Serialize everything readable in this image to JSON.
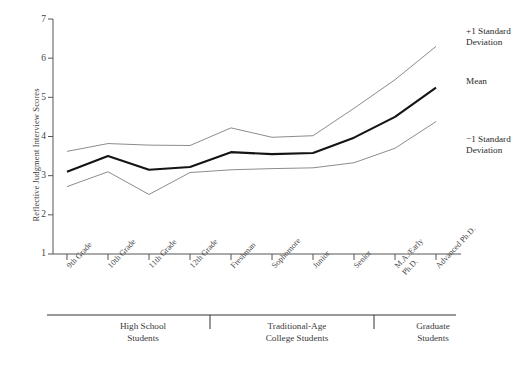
{
  "chart_data": {
    "type": "line",
    "title": "",
    "xlabel": "",
    "ylabel": "Reflective Judgment Interview Scores",
    "ylim": [
      1,
      7
    ],
    "yticks": [
      1,
      2,
      3,
      4,
      5,
      6,
      7
    ],
    "grid": false,
    "legend_position": "right",
    "categories": [
      "9th Grade",
      "10th Grade",
      "11th Grade",
      "12th Grade",
      "Freshman",
      "Sophomore",
      "Junior",
      "Senior",
      "M.A./Early Ph.D.",
      "Advanced Ph.D."
    ],
    "series": [
      {
        "name": "+1 Standard Deviation",
        "color": "#8c8c8c",
        "values": [
          3.62,
          3.82,
          3.78,
          3.77,
          4.22,
          3.98,
          4.02,
          4.72,
          5.45,
          6.3
        ]
      },
      {
        "name": "Mean",
        "color": "#141414",
        "values": [
          3.1,
          3.5,
          3.15,
          3.22,
          3.6,
          3.55,
          3.58,
          3.97,
          4.5,
          5.25
        ]
      },
      {
        "name": "-1 Standard Deviation",
        "color": "#8c8c8c",
        "values": [
          2.72,
          3.1,
          2.52,
          3.08,
          3.15,
          3.18,
          3.2,
          3.33,
          3.7,
          4.38
        ]
      }
    ],
    "group_brackets": [
      {
        "label": "High School\nStudents",
        "from": "9th Grade",
        "to": "12th Grade"
      },
      {
        "label": "Traditional-Age\nCollege Students",
        "from": "Freshman",
        "to": "Senior"
      },
      {
        "label": "Graduate\nStudents",
        "from": "M.A./Early Ph.D.",
        "to": "Advanced Ph.D."
      }
    ]
  },
  "axis": {
    "y_label": "Reflective Judgment Interview Scores",
    "y_ticks": [
      "7",
      "6",
      "5",
      "4",
      "3",
      "2",
      "1"
    ]
  },
  "xticks": [
    {
      "label": "9th Grade"
    },
    {
      "label": "10th Grade"
    },
    {
      "label": "11th Grade"
    },
    {
      "label": "12th Grade"
    },
    {
      "label": "Freshman"
    },
    {
      "label": "Sophomore"
    },
    {
      "label": "Junior"
    },
    {
      "label": "Senior"
    },
    {
      "label": "M.A./Early Ph.D."
    },
    {
      "label": "Advanced Ph.D."
    }
  ],
  "legend": {
    "upper": "+1 Standard\n  Deviation",
    "mean": "Mean",
    "lower": "−1 Standard\n  Deviation"
  },
  "groups": {
    "high_school": "High School\nStudents",
    "college": "Traditional-Age\nCollege Students",
    "graduate": "Graduate\nStudents"
  }
}
